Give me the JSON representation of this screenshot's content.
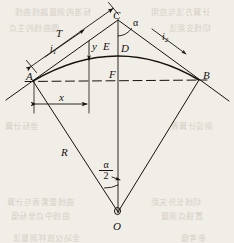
{
  "figure": {
    "ink_color": "#16130f",
    "paper_color": "#f1eee8",
    "points": [
      {
        "id": "A",
        "label": "A",
        "x": 33,
        "y": 81,
        "role": "curve-start-point"
      },
      {
        "id": "B",
        "label": "B",
        "x": 199,
        "y": 80,
        "role": "curve-end-point"
      },
      {
        "id": "C",
        "label": "C",
        "x": 118,
        "y": 20,
        "role": "tangent-intersection-point"
      },
      {
        "id": "D",
        "label": "D",
        "x": 118,
        "y": 55,
        "role": "curve-midpoint"
      },
      {
        "id": "E",
        "label": "E",
        "x": 118,
        "y": 47,
        "role": "chord-external-point"
      },
      {
        "id": "F",
        "label": "F",
        "x": 118,
        "y": 80,
        "role": "chord-midpoint"
      },
      {
        "id": "O",
        "label": "O",
        "x": 118,
        "y": 220,
        "role": "circle-center"
      }
    ],
    "labels": [
      {
        "name": "point-a-label",
        "text": "A",
        "x": 28,
        "y": 74
      },
      {
        "name": "point-b-label",
        "text": "B",
        "x": 203,
        "y": 73
      },
      {
        "name": "point-c-label",
        "text": "C",
        "x": 114,
        "y": 13
      },
      {
        "name": "point-d-label",
        "text": "D",
        "x": 121,
        "y": 47
      },
      {
        "name": "point-e-label",
        "text": "E",
        "x": 104,
        "y": 44
      },
      {
        "name": "point-f-label",
        "text": "F",
        "x": 110,
        "y": 72
      },
      {
        "name": "point-o-label",
        "text": "O",
        "x": 114,
        "y": 226
      },
      {
        "name": "radius-label",
        "text": "R",
        "x": 62,
        "y": 152
      },
      {
        "name": "tangent-length-label",
        "text": "T",
        "x": 57,
        "y": 33
      },
      {
        "name": "abscissa-label",
        "text": "x",
        "x": 61,
        "y": 97
      },
      {
        "name": "ordinate-label",
        "text": "y",
        "x": 92,
        "y": 46
      }
    ],
    "greek_labels": [
      {
        "name": "alpha-angle-label",
        "text": "α",
        "x": 134,
        "y": 22
      },
      {
        "name": "half-alpha-numerator",
        "text": "α",
        "x": 104,
        "y": 165
      },
      {
        "name": "half-alpha-denominator",
        "text": "2",
        "x": 104,
        "y": 175
      }
    ],
    "chainage_labels": [
      {
        "name": "chainage-i1-label",
        "base": "i",
        "sub": "1",
        "x": 52,
        "y": 49
      },
      {
        "name": "chainage-i2-label",
        "base": "i",
        "sub": "2",
        "x": 163,
        "y": 37
      }
    ],
    "elements": {
      "arc": "circular curve from A through D to B",
      "chord": "dashed line A–B",
      "back_tangent": "line through A and C",
      "forward_tangent": "line through C and B",
      "radius_left": "line O–A",
      "radius_right": "line O–B",
      "axis": "vertical line C–D–F–O"
    }
  },
  "bleed_text": {
    "lines": [
      {
        "text": "标准的测量路线曲线",
        "x": 14,
        "y": 6,
        "size": 8
      },
      {
        "text": "计算方法与应用",
        "x": 150,
        "y": 6,
        "size": 8
      },
      {
        "text": "圆曲线的主点",
        "x": 8,
        "y": 22,
        "size": 8
      },
      {
        "text": "切线支距法",
        "x": 168,
        "y": 22,
        "size": 8
      },
      {
        "text": "坐标计算",
        "x": 4,
        "y": 120,
        "size": 8
      },
      {
        "text": "测设计算表",
        "x": 170,
        "y": 120,
        "size": 8
      },
      {
        "text": "曲线要素表与计算",
        "x": 6,
        "y": 196,
        "size": 8
      },
      {
        "text": "切线长外矢距",
        "x": 150,
        "y": 196,
        "size": 8
      },
      {
        "text": "曲线中点坐标值",
        "x": 10,
        "y": 210,
        "size": 8
      },
      {
        "text": "置镜点测量",
        "x": 160,
        "y": 210,
        "size": 8
      },
      {
        "text": "全站仪放样测量法",
        "x": 12,
        "y": 232,
        "size": 8
      },
      {
        "text": "参考值",
        "x": 180,
        "y": 232,
        "size": 8
      }
    ]
  }
}
